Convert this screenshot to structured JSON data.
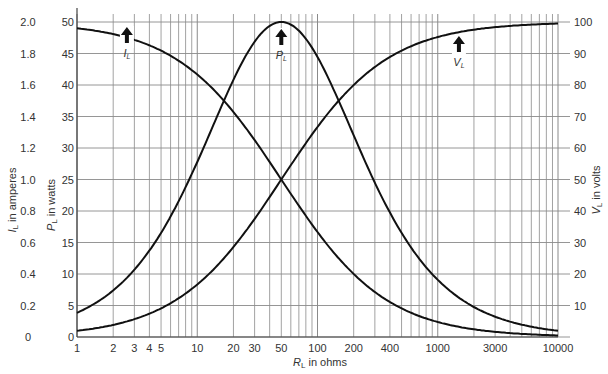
{
  "chart_data": {
    "type": "line",
    "title": "",
    "xscale": "log",
    "xlabel": "R_L in ohms",
    "xlabel_parts": {
      "sym": "R",
      "sub": "L",
      "rest": "in ohms"
    },
    "xlim": [
      1,
      10000
    ],
    "x_ticks": [
      1,
      2,
      3,
      4,
      5,
      10,
      20,
      30,
      50,
      100,
      200,
      400,
      1000,
      3000,
      10000
    ],
    "x_tick_labels": [
      "1",
      "2",
      "3",
      "4",
      "5",
      "10",
      "20",
      "30",
      "50",
      "100",
      "200",
      "400",
      "1000",
      "3000",
      "10000"
    ],
    "y_axes": [
      {
        "id": "current",
        "label": "I_L in amperes",
        "sym": "I",
        "sub": "L",
        "rest": "in amperes",
        "ylim": [
          0,
          2.0
        ],
        "tick_labels": [
          "0",
          "0.2",
          "0.4",
          "0.6",
          "0.8",
          "1.0",
          "1.2",
          "1.4",
          "1.6",
          "1.8",
          "2.0"
        ]
      },
      {
        "id": "power",
        "label": "P_L in watts",
        "sym": "P",
        "sub": "L",
        "rest": "in watts",
        "ylim": [
          0,
          50
        ],
        "tick_labels": [
          "0",
          "5",
          "10",
          "15",
          "20",
          "25",
          "30",
          "35",
          "40",
          "45",
          "50"
        ]
      },
      {
        "id": "voltage",
        "label": "V_L in volts",
        "sym": "V",
        "sub": "L",
        "rest": "in volts",
        "ylim": [
          0,
          100
        ],
        "position": "right",
        "tick_labels": [
          "10",
          "20",
          "30",
          "40",
          "50",
          "60",
          "70",
          "80",
          "90",
          "100"
        ]
      }
    ],
    "grid": true,
    "legend": "arrows",
    "series": [
      {
        "name": "I_L",
        "axis": "current",
        "x": [
          1,
          2,
          5,
          10,
          20,
          50,
          100,
          200,
          500,
          1000,
          2000,
          5000,
          10000
        ],
        "values": [
          1.96,
          1.92,
          1.82,
          1.67,
          1.43,
          1.0,
          0.67,
          0.4,
          0.18,
          0.095,
          0.049,
          0.0198,
          0.00995
        ]
      },
      {
        "name": "P_L",
        "axis": "power",
        "x": [
          1,
          2,
          5,
          10,
          20,
          50,
          100,
          200,
          500,
          1000,
          2000,
          5000,
          10000
        ],
        "values": [
          3.8,
          7.4,
          16.5,
          27.8,
          40.8,
          50.0,
          44.4,
          32.0,
          16.5,
          9.1,
          4.8,
          1.96,
          0.99
        ]
      },
      {
        "name": "V_L",
        "axis": "voltage",
        "x": [
          1,
          2,
          5,
          10,
          20,
          50,
          100,
          200,
          500,
          1000,
          2000,
          5000,
          10000
        ],
        "values": [
          1.96,
          3.8,
          9.1,
          16.7,
          28.6,
          50.0,
          66.7,
          80.0,
          90.9,
          95.2,
          97.6,
          99.0,
          99.5
        ]
      }
    ],
    "annotations": [
      {
        "label_sym": "I",
        "label_sub": "L",
        "x": 2.6,
        "arrow": "up"
      },
      {
        "label_sym": "P",
        "label_sub": "L",
        "x": 50,
        "arrow": "up"
      },
      {
        "label_sym": "V",
        "label_sub": "L",
        "x": 1500,
        "arrow": "up"
      }
    ]
  }
}
